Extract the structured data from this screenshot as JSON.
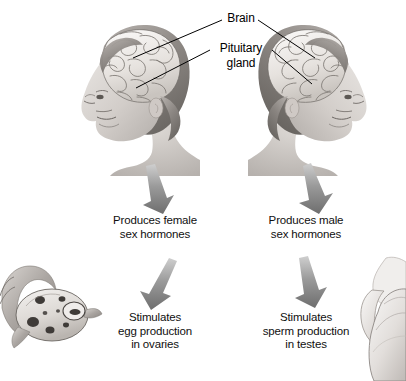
{
  "figure": {
    "type": "biology-diagram",
    "background_color": "#ffffff",
    "text_color": "#101010",
    "arrow_color": "#8a8a8a",
    "leader_line_color": "#000000"
  },
  "callouts": {
    "brain": "Brain",
    "pituitary_line1": "Pituitary",
    "pituitary_line2": "gland"
  },
  "columns": [
    {
      "id": "female",
      "head_label": "female-head-illustration",
      "organ_label": "ovary-illustration",
      "hormone_line1": "Produces female",
      "hormone_line2": "sex hormones",
      "effect_line1": "Stimulates",
      "effect_line2": "egg production",
      "effect_line3": "in ovaries"
    },
    {
      "id": "male",
      "head_label": "male-head-illustration",
      "organ_label": "testis-illustration",
      "hormone_line1": "Produces male",
      "hormone_line2": "sex hormones",
      "effect_line1": "Stimulates",
      "effect_line2": "sperm production",
      "effect_line3": "in testes"
    }
  ]
}
